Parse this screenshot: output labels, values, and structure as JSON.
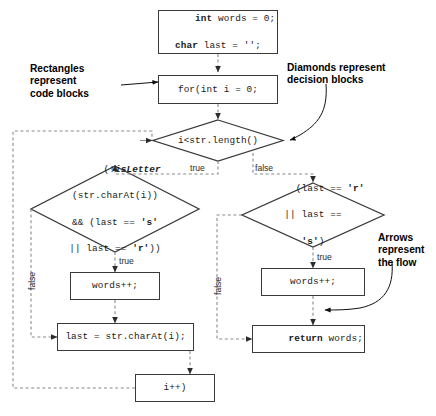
{
  "diagram": {
    "stroke_color": "#3a3a3a",
    "dashed_color": "#8a8a8a",
    "text_color": "#1a1a1a"
  },
  "nodes": {
    "init": {
      "type": "rect",
      "line1_kw": "int",
      "line1_rest": " words = 0;",
      "line2_kw": "char",
      "line2_rest": " last = '';"
    },
    "for_loop": {
      "type": "rect",
      "text": "for(int i = 0;"
    },
    "condition_loop": {
      "type": "diamond",
      "text": "i<str.length()"
    },
    "letter_check": {
      "type": "diamond",
      "line1_a": "(!",
      "line1_italic": "isLetter",
      "line2": "(str.charAt(i))",
      "line3_a": "&& (last == ",
      "line3_char": "'s'",
      "line4_a": "|| last == ",
      "line4_char": "'r'",
      "line4_b": "))"
    },
    "last_check": {
      "type": "diamond",
      "line1_a": "(last == ",
      "line1_char": "'r'",
      "line2": "|| last ==",
      "line3_char": "'s'",
      "line3_b": ")"
    },
    "words_inc_left": {
      "type": "rect",
      "text": "words++;"
    },
    "words_inc_right": {
      "type": "rect",
      "text": "words++;"
    },
    "assign_last": {
      "type": "rect",
      "text": "last = str.charAt(i);"
    },
    "increment_i": {
      "type": "rect",
      "text": "i++)"
    },
    "return_words": {
      "type": "rect",
      "kw": "return",
      "rest": " words;"
    }
  },
  "edge_labels": {
    "loop_true": "true",
    "loop_false": "false",
    "letter_true": "true",
    "letter_false": "false",
    "last_true": "true",
    "last_false": "false"
  },
  "annotations": {
    "rectangles": "Rectangles\nrepresent\ncode blocks",
    "diamonds": "Diamonds represent\ndecision blocks",
    "arrows": "Arrows\nrepresent\nthe flow"
  }
}
